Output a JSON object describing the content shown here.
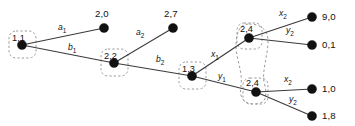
{
  "diagram": {
    "type": "labelled-binary-tree",
    "background_color": "#ffffff",
    "line_color": "#3a3a3a",
    "node_color": "#111111",
    "dash_color": "#9a9a9a",
    "nodes": [
      {
        "id": "root",
        "label": "1,1",
        "label_pos": "inside",
        "x": 22,
        "y": 45,
        "boxed": true
      },
      {
        "id": "n20",
        "label": "2,0",
        "label_pos": "above",
        "x": 104,
        "y": 28,
        "boxed": false
      },
      {
        "id": "n22",
        "label": "2,2",
        "label_pos": "inside",
        "x": 114,
        "y": 63,
        "boxed": true
      },
      {
        "id": "n27",
        "label": "2,7",
        "label_pos": "above",
        "x": 173,
        "y": 28,
        "boxed": false
      },
      {
        "id": "n13",
        "label": "1,3",
        "label_pos": "inside",
        "x": 192,
        "y": 76,
        "boxed": true
      },
      {
        "id": "n24a",
        "label": "2,4",
        "label_pos": "above",
        "x": 249,
        "y": 38,
        "boxed": true
      },
      {
        "id": "n24b",
        "label": "2,4",
        "label_pos": "above",
        "x": 256,
        "y": 92,
        "boxed": true
      },
      {
        "id": "l90",
        "label": "9,0",
        "label_pos": "right",
        "x": 312,
        "y": 17,
        "boxed": false
      },
      {
        "id": "l01",
        "label": "0,1",
        "label_pos": "right",
        "x": 312,
        "y": 45,
        "boxed": false
      },
      {
        "id": "l10",
        "label": "1,0",
        "label_pos": "right",
        "x": 312,
        "y": 89,
        "boxed": false
      },
      {
        "id": "l18",
        "label": "1,8",
        "label_pos": "right",
        "x": 312,
        "y": 116,
        "boxed": false
      }
    ],
    "edges": [
      {
        "from": "root",
        "to": "n20",
        "label": "a",
        "sub": "1",
        "lx": 62,
        "ly": 27
      },
      {
        "from": "root",
        "to": "n22",
        "label": "b",
        "sub": "1",
        "lx": 71,
        "ly": 47
      },
      {
        "from": "n22",
        "to": "n27",
        "label": "a",
        "sub": "2",
        "lx": 139,
        "ly": 32
      },
      {
        "from": "n22",
        "to": "n13",
        "label": "b",
        "sub": "2",
        "lx": 159,
        "ly": 59
      },
      {
        "from": "n13",
        "to": "n24a",
        "label": "x",
        "sub": "1",
        "lx": 214,
        "ly": 54
      },
      {
        "from": "n13",
        "to": "n24b",
        "label": "y",
        "sub": "1",
        "lx": 221,
        "ly": 76
      },
      {
        "from": "n24a",
        "to": "l90",
        "label": "x",
        "sub": "2",
        "lx": 282,
        "ly": 13
      },
      {
        "from": "n24a",
        "to": "l01",
        "label": "y",
        "sub": "2",
        "lx": 289,
        "ly": 30
      },
      {
        "from": "n24b",
        "to": "l10",
        "label": "x",
        "sub": "2",
        "lx": 287,
        "ly": 79
      },
      {
        "from": "n24b",
        "to": "l18",
        "label": "y",
        "sub": "2",
        "lx": 292,
        "ly": 99
      }
    ],
    "grouping": {
      "name": "merged-state-group",
      "members": [
        "n24a",
        "n24b"
      ],
      "style": "dashed-closed-curve"
    }
  }
}
